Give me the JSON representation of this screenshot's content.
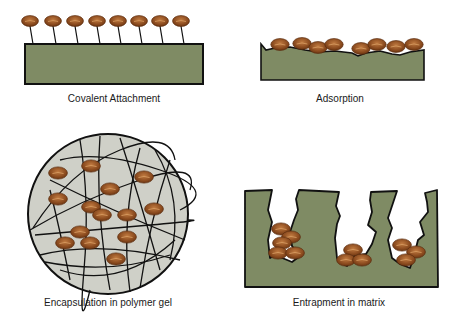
{
  "colors": {
    "support": "#7f8b64",
    "gel": "#cfd0c8",
    "enzyme": "#8a4a1e",
    "enzyme_light": "#b8743e",
    "outline": "#111111"
  },
  "panels": [
    {
      "id": "covalent",
      "label": "Covalent Attachment"
    },
    {
      "id": "adsorption",
      "label": "Adsorption"
    },
    {
      "id": "encapsulation",
      "label": "Encapsulation in polymer gel"
    },
    {
      "id": "entrapment",
      "label": "Entrapment in matrix"
    }
  ],
  "covalent": {
    "enzymes_x": [
      30,
      53,
      75,
      97,
      118,
      139,
      160,
      181
    ]
  }
}
